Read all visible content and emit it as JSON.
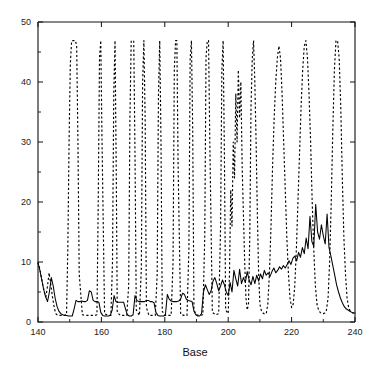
{
  "chart_data": {
    "type": "line",
    "title": "",
    "xlabel": "Base",
    "ylabel": "",
    "xlim": [
      140,
      240
    ],
    "ylim": [
      0,
      50
    ],
    "grid": false,
    "legend": "none",
    "xticks": [
      140,
      160,
      180,
      200,
      220,
      240
    ],
    "xtick_labels": [
      "140",
      "160",
      "180",
      "200",
      "220",
      "240"
    ],
    "xminor_ticks": [
      150,
      170,
      190,
      210,
      230
    ],
    "yticks": [
      0,
      10,
      20,
      30,
      40,
      50
    ],
    "ytick_labels": [
      "0",
      "10",
      "20",
      "30",
      "40",
      "50"
    ],
    "yminor_ticks": [
      5,
      15,
      25,
      35,
      45
    ],
    "series": [
      {
        "name": "solid",
        "style": "solid",
        "color": "#000000",
        "x": [
          140,
          140.6,
          141.2,
          141.8,
          142.4,
          143,
          143.6,
          144.2,
          144.8,
          145.4,
          146,
          146.6,
          147.2,
          147.8,
          148.4,
          149,
          149.6,
          150.2,
          150.8,
          151.4,
          152,
          152.6,
          153.2,
          153.8,
          154.4,
          155,
          155.6,
          156.2,
          156.8,
          157.4,
          158,
          158.6,
          159.2,
          159.8,
          160.4,
          161,
          161.6,
          162.2,
          162.8,
          163.4,
          164,
          164.6,
          165.2,
          165.8,
          166.4,
          167,
          167.6,
          168.2,
          168.8,
          169.4,
          170,
          170.6,
          171.2,
          171.8,
          172.4,
          173,
          173.6,
          174.2,
          174.8,
          175.4,
          176,
          176.6,
          177.2,
          177.8,
          178.4,
          179,
          179.6,
          180.2,
          180.8,
          181.4,
          182,
          182.6,
          183.2,
          183.8,
          184.4,
          185,
          185.6,
          186.2,
          186.8,
          187.4,
          188,
          188.6,
          189.2,
          189.8,
          190.4,
          191,
          191.6,
          192.2,
          192.8,
          193.4,
          194,
          194.6,
          195.2,
          195.8,
          196.4,
          197,
          197.6,
          198.2,
          198.8,
          199.4,
          200,
          200.6,
          201.2,
          201.8,
          202.4,
          203,
          203.6,
          204.2,
          204.8,
          205.4,
          206,
          206.6,
          207.2,
          207.8,
          208.4,
          209,
          209.6,
          210.2,
          210.8,
          211.4,
          212,
          212.6,
          213.2,
          213.8,
          214.4,
          215,
          215.6,
          216.2,
          216.8,
          217.4,
          218,
          218.6,
          219.2,
          219.8,
          220.4,
          221,
          221.6,
          222.2,
          222.8,
          223.4,
          224,
          224.6,
          225.2,
          225.8,
          226.4,
          227,
          227.6,
          228.2,
          228.8,
          229.4,
          230,
          230.6,
          231.2,
          231.8,
          232.4,
          233,
          233.6,
          234.2,
          234.8,
          235.4,
          236,
          236.6,
          237.2,
          237.8,
          238.4,
          239,
          239.4,
          240
        ],
        "y": [
          9.8,
          8.6,
          7.0,
          5.4,
          4.2,
          3.4,
          5.0,
          7.4,
          6.0,
          4.0,
          2.6,
          1.8,
          1.4,
          1.2,
          1.1,
          1.1,
          1.0,
          1.0,
          1.0,
          2.2,
          3.6,
          3.4,
          3.4,
          3.5,
          3.4,
          3.4,
          3.6,
          5.2,
          5.0,
          3.6,
          3.4,
          3.4,
          3.3,
          1.6,
          1.1,
          1.0,
          1.0,
          1.0,
          1.1,
          2.0,
          4.4,
          3.4,
          3.3,
          3.3,
          3.3,
          3.3,
          2.2,
          1.2,
          1.0,
          1.0,
          1.2,
          4.4,
          3.6,
          3.4,
          3.4,
          3.4,
          3.4,
          3.6,
          3.6,
          3.4,
          3.4,
          3.2,
          1.6,
          1.1,
          1.0,
          1.0,
          1.0,
          1.2,
          4.6,
          3.8,
          3.5,
          3.4,
          3.4,
          3.4,
          3.5,
          3.8,
          4.8,
          4.6,
          3.8,
          3.6,
          3.5,
          3.4,
          1.8,
          1.2,
          1.0,
          1.0,
          1.4,
          5.0,
          6.2,
          5.4,
          4.6,
          5.2,
          6.8,
          7.4,
          6.4,
          5.2,
          6.0,
          7.0,
          6.2,
          5.0,
          4.4,
          6.6,
          5.0,
          8.6,
          7.2,
          6.0,
          8.8,
          6.4,
          7.4,
          6.6,
          8.4,
          7.0,
          6.2,
          7.6,
          6.4,
          7.8,
          6.8,
          8.0,
          7.2,
          8.6,
          7.8,
          8.2,
          7.6,
          8.4,
          9.0,
          8.2,
          8.6,
          9.2,
          8.8,
          9.4,
          9.0,
          9.6,
          10.2,
          9.6,
          10.6,
          11.0,
          10.2,
          11.6,
          10.8,
          12.4,
          11.4,
          14.0,
          12.2,
          17.6,
          13.4,
          12.6,
          19.6,
          15.0,
          13.8,
          16.2,
          14.4,
          13.0,
          18.0,
          12.4,
          11.0,
          9.4,
          7.8,
          6.2,
          5.0,
          4.0,
          3.2,
          2.6,
          2.2,
          2.0,
          1.8,
          1.6,
          1.5,
          1.5
        ]
      },
      {
        "name": "dashed",
        "style": "dashed",
        "color": "#000000",
        "x": [
          140,
          140.5,
          141,
          141.5,
          142,
          142.5,
          143,
          143.5,
          144,
          144.5,
          145,
          145.3,
          145.6,
          146,
          146.5,
          147,
          148,
          149,
          149.4,
          149.8,
          150.2,
          150.6,
          151,
          151.4,
          151.8,
          152.2,
          152.6,
          153,
          154,
          155,
          156,
          157,
          158,
          158.6,
          159,
          159.4,
          159.8,
          160.2,
          161,
          162,
          163,
          163.5,
          163.9,
          164.3,
          164.7,
          165,
          166,
          167,
          168,
          168.6,
          169,
          169.4,
          169.8,
          170.2,
          170.6,
          171,
          172,
          172.6,
          173,
          173.4,
          173.8,
          174.2,
          175,
          176,
          177,
          177.6,
          178,
          178.4,
          178.8,
          179.2,
          180,
          181,
          182,
          182.6,
          183,
          183.4,
          183.8,
          184.2,
          185,
          186,
          187,
          187.6,
          188,
          188.4,
          188.8,
          189.2,
          190,
          191,
          192,
          192.6,
          193,
          193.4,
          193.8,
          194.2,
          195,
          196,
          197,
          197.6,
          198,
          198.4,
          198.8,
          199.2,
          200,
          200.4,
          200.8,
          201.2,
          201.6,
          202,
          202.4,
          202.8,
          203.2,
          203.6,
          204,
          204.4,
          204.8,
          205.2,
          205.6,
          206,
          206.4,
          206.8,
          207.2,
          207.6,
          208,
          208.4,
          208.8,
          209.2,
          209.6,
          210,
          210.4,
          210.8,
          211.2,
          211.6,
          212,
          212.5,
          213,
          213.5,
          214,
          214.5,
          215,
          215.5,
          216,
          216.5,
          217,
          217.5,
          218,
          218.5,
          219,
          219.5,
          220,
          220.5,
          221,
          221.5,
          222,
          222.5,
          223,
          223.5,
          224,
          224.5,
          225,
          225.5,
          226,
          226.5,
          227,
          227.5,
          228,
          228.5,
          229,
          229.5,
          230,
          230.5,
          231,
          231.5,
          232,
          232.5,
          233,
          233.5,
          234,
          234.5,
          235,
          235.5,
          236,
          236.5,
          237,
          237.5,
          238,
          238.5,
          239,
          239.5,
          240
        ],
        "y": [
          10.0,
          9.0,
          7.6,
          6.2,
          5.0,
          4.2,
          6.0,
          8.2,
          6.4,
          4.4,
          2.8,
          2.0,
          1.4,
          1.2,
          1.1,
          1.1,
          1.1,
          1.2,
          12.0,
          30.0,
          43.0,
          46.8,
          46.9,
          46.9,
          46.9,
          46.0,
          30.0,
          8.0,
          1.2,
          1.1,
          1.1,
          1.1,
          1.1,
          1.2,
          20.0,
          44.0,
          46.9,
          30.0,
          1.4,
          1.1,
          1.1,
          10.0,
          38.0,
          46.9,
          24.0,
          1.6,
          1.1,
          1.1,
          1.1,
          6.0,
          34.0,
          46.8,
          46.9,
          46.9,
          28.0,
          2.0,
          1.1,
          9.0,
          40.0,
          46.9,
          34.0,
          2.4,
          1.1,
          1.1,
          1.1,
          8.0,
          38.0,
          46.9,
          30.0,
          1.8,
          1.1,
          1.1,
          1.1,
          10.0,
          42.0,
          46.9,
          46.9,
          26.0,
          1.3,
          1.1,
          1.1,
          12.0,
          44.0,
          46.9,
          32.0,
          2.0,
          1.2,
          1.1,
          1.2,
          14.0,
          44.0,
          46.9,
          46.9,
          30.0,
          1.6,
          1.2,
          1.4,
          16.0,
          42.0,
          46.9,
          28.0,
          2.0,
          1.4,
          8.0,
          22.0,
          16.0,
          30.0,
          24.0,
          38.0,
          30.0,
          42.0,
          34.0,
          40.0,
          26.0,
          18.0,
          10.0,
          4.0,
          2.0,
          3.0,
          14.0,
          36.0,
          44.0,
          46.9,
          40.0,
          30.0,
          18.0,
          8.0,
          3.0,
          2.0,
          1.6,
          1.4,
          1.3,
          1.4,
          3.0,
          8.0,
          16.0,
          26.0,
          34.0,
          40.0,
          44.0,
          46.0,
          44.0,
          38.0,
          30.0,
          22.0,
          14.0,
          8.0,
          4.0,
          2.4,
          3.0,
          6.0,
          12.0,
          20.0,
          28.0,
          36.0,
          42.0,
          46.0,
          46.9,
          44.0,
          38.0,
          30.0,
          20.0,
          12.0,
          6.0,
          3.0,
          2.0,
          1.6,
          1.4,
          1.4,
          1.5,
          2.0,
          4.0,
          10.0,
          20.0,
          32.0,
          42.0,
          46.9,
          46.9,
          44.0,
          36.0,
          24.0,
          14.0,
          8.0,
          4.0,
          2.4,
          1.8,
          1.6,
          1.5,
          1.5
        ]
      }
    ]
  }
}
